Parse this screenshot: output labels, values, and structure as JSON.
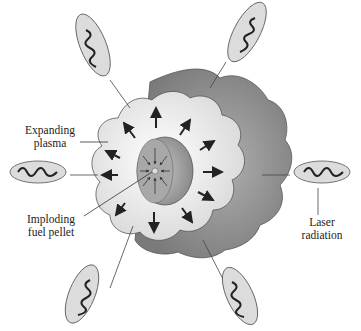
{
  "diagram": {
    "type": "inertial-confinement-fusion",
    "labels": {
      "expanding_plasma": [
        "Expanding",
        "plasma"
      ],
      "imploding_pellet": [
        "Imploding",
        "fuel pellet"
      ],
      "laser_radiation": [
        "Laser",
        "radiation"
      ]
    },
    "beams": 6,
    "colors": {
      "outer_plasma": "#8a8a8a",
      "inner_plasma": "#e6e6e6",
      "pellet": "#a0a0a0",
      "beam_ellipse": "#d8d8d8",
      "line": "#333333"
    }
  }
}
